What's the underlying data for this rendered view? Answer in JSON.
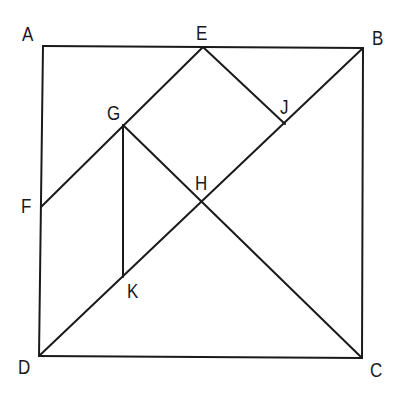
{
  "diagram": {
    "type": "geometry-figure",
    "stroke_color": "#1a1a1a",
    "background": "#ffffff",
    "points": {
      "A": {
        "x": 43,
        "y": 46
      },
      "E": {
        "x": 203,
        "y": 47
      },
      "B": {
        "x": 363,
        "y": 48
      },
      "F": {
        "x": 41,
        "y": 207
      },
      "G": {
        "x": 123,
        "y": 125
      },
      "J": {
        "x": 285,
        "y": 124
      },
      "H": {
        "x": 203,
        "y": 202
      },
      "K": {
        "x": 123,
        "y": 277
      },
      "D": {
        "x": 39,
        "y": 356
      },
      "C": {
        "x": 362,
        "y": 358
      }
    },
    "segments": [
      [
        "A",
        "B"
      ],
      [
        "B",
        "C"
      ],
      [
        "C",
        "D"
      ],
      [
        "D",
        "A"
      ],
      [
        "D",
        "B"
      ],
      [
        "E",
        "F"
      ],
      [
        "E",
        "J"
      ],
      [
        "G",
        "C"
      ],
      [
        "G",
        "K"
      ]
    ],
    "labels": [
      {
        "text": "A",
        "x": 22,
        "y": 24
      },
      {
        "text": "E",
        "x": 196,
        "y": 23
      },
      {
        "text": "B",
        "x": 372,
        "y": 28
      },
      {
        "text": "G",
        "x": 107,
        "y": 103
      },
      {
        "text": "J",
        "x": 280,
        "y": 97
      },
      {
        "text": "H",
        "x": 195,
        "y": 173
      },
      {
        "text": "F",
        "x": 21,
        "y": 196
      },
      {
        "text": "K",
        "x": 127,
        "y": 281
      },
      {
        "text": "D",
        "x": 18,
        "y": 357
      },
      {
        "text": "C",
        "x": 370,
        "y": 360
      }
    ]
  }
}
